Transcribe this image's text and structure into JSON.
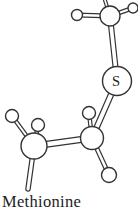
{
  "figure": {
    "caption": "Methionine"
  },
  "colors": {
    "background": "#ffffff",
    "line": "#333333",
    "atom_fill": "#ffffff",
    "label_text": "#1c1c1c"
  },
  "molecule": {
    "name": "Methionine",
    "labeled_atom": "S",
    "atoms": [
      {
        "name": "atom-carbon-methyl",
        "element": "C",
        "x": 110,
        "y": 16,
        "r": 10
      },
      {
        "name": "atom-hydrogen",
        "element": "H",
        "x": 77,
        "y": 15,
        "r": 5.5
      },
      {
        "name": "atom-hydrogen",
        "element": "H",
        "x": 133,
        "y": 8,
        "r": 5
      },
      {
        "name": "atom-sulfur",
        "element": "S",
        "label": "S",
        "x": 117,
        "y": 81,
        "r": 14.5
      },
      {
        "name": "atom-carbon-ch2-right",
        "element": "C",
        "x": 92,
        "y": 138,
        "r": 11.5
      },
      {
        "name": "atom-hydrogen",
        "element": "H",
        "x": 89,
        "y": 113,
        "r": 6.5
      },
      {
        "name": "atom-hydrogen",
        "element": "H",
        "x": 109,
        "y": 175,
        "r": 7.5
      },
      {
        "name": "atom-carbon-ch2-left",
        "element": "C",
        "x": 34,
        "y": 146,
        "r": 13
      },
      {
        "name": "atom-hydrogen",
        "element": "H",
        "x": 12,
        "y": 116,
        "r": 6.5
      },
      {
        "name": "atom-hydrogen",
        "element": "H",
        "x": 38,
        "y": 125,
        "r": 6.5
      }
    ],
    "bonds": [
      {
        "name": "bond-methylC-offscreenH",
        "x1": 110,
        "y1": 16,
        "x2": 103,
        "y2": -6,
        "w": 4,
        "cap": "butt"
      },
      {
        "name": "bond-methylC-H-right",
        "x1": 110,
        "y1": 16,
        "x2": 133,
        "y2": 8,
        "w": 4.5,
        "cap": "butt"
      },
      {
        "name": "bond-methylC-H-left",
        "x1": 110,
        "y1": 16,
        "x2": 77,
        "y2": 15,
        "w": 5,
        "cap": "butt"
      },
      {
        "name": "bond-methylC-S",
        "x1": 110,
        "y1": 16,
        "x2": 117,
        "y2": 81,
        "w": 6,
        "cap": "butt"
      },
      {
        "name": "bond-S-ch2Right",
        "x1": 117,
        "y1": 81,
        "x2": 92,
        "y2": 138,
        "w": 6.5,
        "cap": "butt"
      },
      {
        "name": "bond-ch2Right-H-top",
        "x1": 92,
        "y1": 138,
        "x2": 89,
        "y2": 113,
        "w": 4.5,
        "cap": "butt"
      },
      {
        "name": "bond-ch2Right-H-bottom",
        "x1": 92,
        "y1": 138,
        "x2": 109,
        "y2": 175,
        "w": 5,
        "cap": "butt"
      },
      {
        "name": "bond-ch2Right-ch2Left",
        "x1": 92,
        "y1": 138,
        "x2": 34,
        "y2": 146,
        "w": 7,
        "cap": "butt"
      },
      {
        "name": "bond-ch2Left-H-upperleft",
        "x1": 34,
        "y1": 146,
        "x2": 12,
        "y2": 116,
        "w": 4.5,
        "cap": "butt"
      },
      {
        "name": "bond-ch2Left-H-top",
        "x1": 34,
        "y1": 146,
        "x2": 38,
        "y2": 125,
        "w": 4.5,
        "cap": "butt"
      },
      {
        "name": "bond-ch2Left-chain-cut",
        "x1": 34,
        "y1": 146,
        "x2": 28,
        "y2": 189,
        "w": 5.5,
        "cap": "round"
      }
    ]
  }
}
